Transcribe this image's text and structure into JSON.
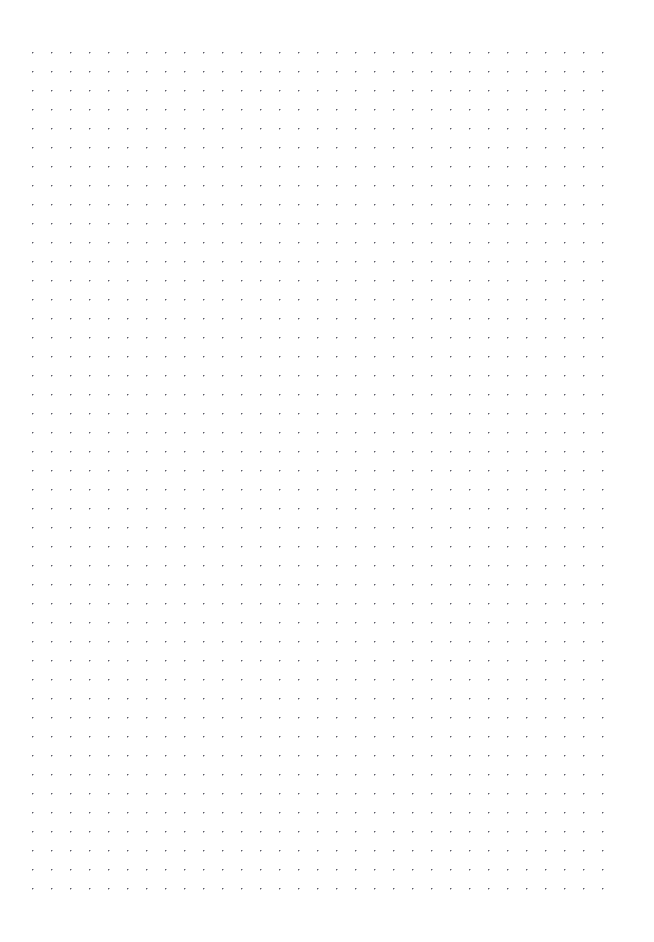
{
  "page": {
    "kind": "dotted-grid-paper",
    "title": "",
    "width_px": 654,
    "height_px": 942,
    "background_color": "#ffffff",
    "has_text": false,
    "has_header": false,
    "has_footer": false,
    "has_page_number": false,
    "visible_text": ""
  },
  "grid": {
    "pattern": "dot-grid",
    "dot_color": "#5a5a66",
    "dot_diameter_px": 1.2,
    "spacing_x_px": 19,
    "spacing_y_px": 19,
    "origin_x_px": 33,
    "origin_y_px": 53,
    "columns": 31,
    "rows": 45,
    "last_column_x_px": 621,
    "last_row_y_px": 889,
    "margin_left_px": 33,
    "margin_right_px": 33,
    "margin_top_px": 53,
    "margin_bottom_px": 53
  },
  "content": {
    "items": []
  }
}
